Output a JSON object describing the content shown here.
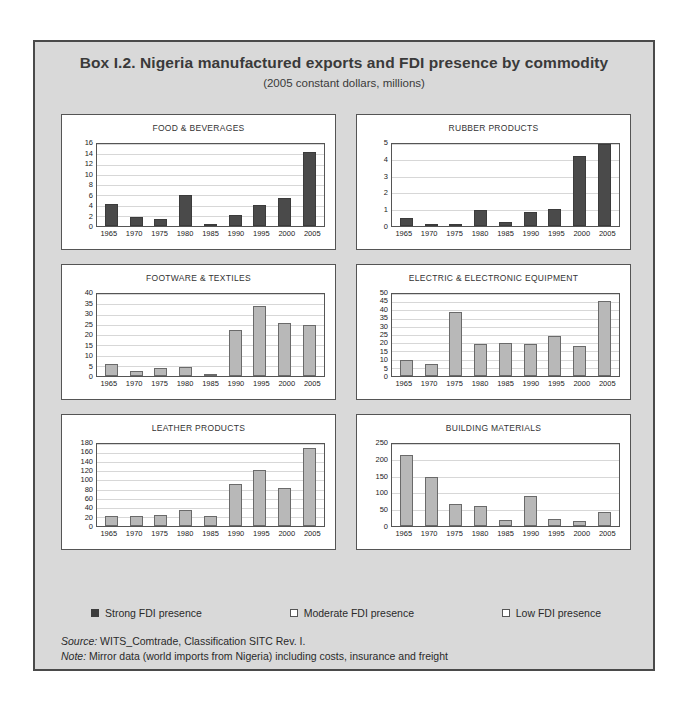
{
  "box": {
    "title": "Box I.2.  Nigeria manufactured exports and FDI presence by commodity",
    "subtitle": "(2005 constant dollars, millions)"
  },
  "legend": {
    "items": [
      {
        "label": "Strong FDI presence",
        "marker": "filled-square",
        "color": "#3d3d3d"
      },
      {
        "label": "Moderate FDI presence",
        "marker": "open-square",
        "color": "#ffffff"
      },
      {
        "label": "Low FDI presence",
        "marker": "open-square",
        "color": "#ffffff"
      }
    ]
  },
  "notes": {
    "source_label": "Source:",
    "source_text": " WITS_Comtrade, Classification SITC Rev. I.",
    "note_label": "Note:",
    "note_text": " Mirror data (world imports from Nigeria) including costs, insurance and freight"
  },
  "chart_data": [
    {
      "type": "bar",
      "title": "FOOD & BEVERAGES",
      "fdi_class": "strong",
      "bar_color": "#4a4a4a",
      "categories": [
        "1965",
        "1970",
        "1975",
        "1980",
        "1985",
        "1990",
        "1995",
        "2000",
        "2005"
      ],
      "values": [
        4.2,
        1.7,
        1.4,
        6.0,
        0.2,
        2.1,
        4.1,
        5.4,
        14.4
      ],
      "xlabel": "",
      "ylabel": "",
      "ylim": [
        0,
        16
      ],
      "yticks": [
        0,
        2,
        4,
        6,
        8,
        10,
        12,
        14,
        16
      ],
      "grid": true
    },
    {
      "type": "bar",
      "title": "RUBBER PRODUCTS",
      "fdi_class": "strong",
      "bar_color": "#4a4a4a",
      "categories": [
        "1965",
        "1970",
        "1975",
        "1980",
        "1985",
        "1990",
        "1995",
        "2000",
        "2005"
      ],
      "values": [
        0.5,
        0.1,
        0.15,
        0.95,
        0.25,
        0.85,
        1.05,
        4.25,
        5.0
      ],
      "xlabel": "",
      "ylabel": "",
      "ylim": [
        0,
        5
      ],
      "yticks": [
        0,
        1,
        2,
        3,
        4,
        5
      ],
      "grid": true
    },
    {
      "type": "bar",
      "title": "FOOTWARE & TEXTILES",
      "fdi_class": "low",
      "bar_color": "#b8b8b8",
      "categories": [
        "1965",
        "1970",
        "1975",
        "1980",
        "1985",
        "1990",
        "1995",
        "2000",
        "2005"
      ],
      "values": [
        6.0,
        2.5,
        3.7,
        4.6,
        0.5,
        22.3,
        34.0,
        26.0,
        24.7
      ],
      "xlabel": "",
      "ylabel": "",
      "ylim": [
        0,
        40
      ],
      "yticks": [
        0,
        5,
        10,
        15,
        20,
        25,
        30,
        35,
        40
      ],
      "grid": true
    },
    {
      "type": "bar",
      "title": "ELECTRIC & ELECTRONIC EQUIPMENT",
      "fdi_class": "low",
      "bar_color": "#b8b8b8",
      "categories": [
        "1965",
        "1970",
        "1975",
        "1980",
        "1985",
        "1990",
        "1995",
        "2000",
        "2005"
      ],
      "values": [
        10.0,
        7.5,
        39.0,
        19.5,
        20.0,
        19.5,
        24.5,
        18.0,
        45.5
      ],
      "xlabel": "",
      "ylabel": "",
      "ylim": [
        0,
        50
      ],
      "yticks": [
        0,
        5,
        10,
        15,
        20,
        25,
        30,
        35,
        40,
        45,
        50
      ],
      "grid": true
    },
    {
      "type": "bar",
      "title": "LEATHER PRODUCTS",
      "fdi_class": "low",
      "bar_color": "#b8b8b8",
      "categories": [
        "1965",
        "1970",
        "1975",
        "1980",
        "1985",
        "1990",
        "1995",
        "2000",
        "2005"
      ],
      "values": [
        23,
        21,
        24,
        36,
        21,
        93,
        122,
        84,
        171
      ],
      "xlabel": "",
      "ylabel": "",
      "ylim": [
        0,
        180
      ],
      "yticks": [
        0,
        20,
        40,
        60,
        80,
        100,
        120,
        140,
        160,
        180
      ],
      "grid": true
    },
    {
      "type": "bar",
      "title": "BUILDING MATERIALS",
      "fdi_class": "low",
      "bar_color": "#b8b8b8",
      "categories": [
        "1965",
        "1970",
        "1975",
        "1980",
        "1985",
        "1990",
        "1995",
        "2000",
        "2005"
      ],
      "values": [
        218,
        150,
        66,
        62,
        17,
        92,
        20,
        16,
        42
      ],
      "xlabel": "",
      "ylabel": "",
      "ylim": [
        0,
        250
      ],
      "yticks": [
        0,
        50,
        100,
        150,
        200,
        250
      ],
      "grid": true
    }
  ]
}
